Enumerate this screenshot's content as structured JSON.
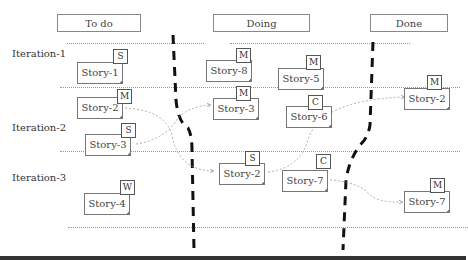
{
  "columns": [
    {
      "label": "To do"
    },
    {
      "label": "Doing"
    },
    {
      "label": "Done"
    }
  ],
  "iterations": [
    {
      "label": "Iteration-1"
    },
    {
      "label": "Iteration-2"
    },
    {
      "label": "Iteration-3"
    }
  ],
  "cards": [
    {
      "label": "Story-1",
      "size": "S"
    },
    {
      "label": "Story-2",
      "size": "M"
    },
    {
      "label": "Story-3",
      "size": "S"
    },
    {
      "label": "Story-4",
      "size": "W"
    },
    {
      "label": "Story-8",
      "size": "M"
    },
    {
      "label": "Story-5",
      "size": "M"
    },
    {
      "label": "Story-3",
      "size": "M"
    },
    {
      "label": "Story-6",
      "size": "C"
    },
    {
      "label": "Story-2",
      "size": "S"
    },
    {
      "label": "Story-7",
      "size": "C"
    },
    {
      "label": "Story-2",
      "size": "M"
    },
    {
      "label": "Story-7",
      "size": "M"
    }
  ]
}
